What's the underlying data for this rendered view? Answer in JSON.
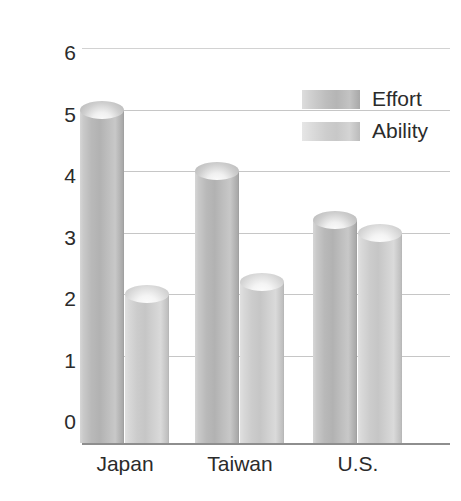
{
  "chart_data": {
    "type": "bar",
    "title": "",
    "xlabel": "",
    "ylabel": "Mean rating",
    "categories": [
      "Japan",
      "Taiwan",
      "U.S."
    ],
    "series": [
      {
        "name": "Effort",
        "values": [
          5.0,
          4.0,
          3.2
        ]
      },
      {
        "name": "Ability",
        "values": [
          2.0,
          2.2,
          3.0
        ]
      }
    ],
    "ylim": [
      0,
      6
    ],
    "yticks": [
      6,
      5,
      4,
      3,
      2,
      1,
      0
    ],
    "ytick_labels": [
      "6",
      "5",
      "4",
      "3",
      "2",
      "1",
      "0"
    ],
    "grid": true,
    "legend_position": "top-right",
    "bar_style": "cylinder",
    "colors": {
      "effort": "#b5b5b5",
      "ability": "#cbcbcb",
      "gridline": "#c6c6c6",
      "axis": "#8e8e8e",
      "text": "#2b2b2b",
      "background": "#ffffff"
    }
  },
  "legend": {
    "items": [
      {
        "label": "Effort"
      },
      {
        "label": "Ability"
      }
    ]
  }
}
